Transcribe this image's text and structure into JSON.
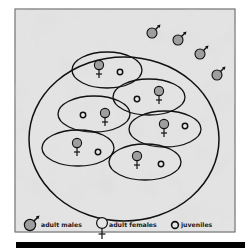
{
  "diagram": {
    "colors": {
      "frame_fill": "#e6e6e6",
      "frame_stroke": "#555555",
      "mottle": "#cfcfcf",
      "line": "#111111",
      "symbol_fill": "#9e9e9e",
      "juvenile_fill": "#e8e8e8",
      "bottom_bar": "#000000"
    },
    "territory": {
      "cx": 124,
      "cy": 139,
      "rx": 95,
      "ry": 82
    },
    "home_ranges": [
      {
        "cx": 107,
        "cy": 70,
        "rx": 35,
        "ry": 18,
        "female": [
          99,
          65
        ],
        "juvenile": [
          120,
          72
        ]
      },
      {
        "cx": 149,
        "cy": 97,
        "rx": 36,
        "ry": 18,
        "female": [
          159,
          91
        ],
        "juvenile": [
          137,
          99
        ]
      },
      {
        "cx": 94,
        "cy": 114,
        "rx": 36,
        "ry": 18,
        "female": [
          105,
          113
        ],
        "juvenile": [
          83,
          115
        ]
      },
      {
        "cx": 165,
        "cy": 129,
        "rx": 36,
        "ry": 18,
        "female": [
          164,
          124
        ],
        "juvenile": [
          185,
          126
        ]
      },
      {
        "cx": 78,
        "cy": 148,
        "rx": 36,
        "ry": 18,
        "female": [
          77,
          143
        ],
        "juvenile": [
          98,
          152
        ]
      },
      {
        "cx": 145,
        "cy": 162,
        "rx": 36,
        "ry": 18,
        "female": [
          137,
          156
        ],
        "juvenile": [
          161,
          164
        ]
      }
    ],
    "males": [
      [
        152,
        33
      ],
      [
        178,
        40
      ],
      [
        200,
        54
      ],
      [
        217,
        75
      ]
    ],
    "legend": {
      "items": [
        {
          "symbol": "male-symbol",
          "label": "adult males"
        },
        {
          "symbol": "female-symbol",
          "label": "adult females"
        },
        {
          "symbol": "juvenile-symbol",
          "label": "juveniles"
        }
      ]
    }
  }
}
